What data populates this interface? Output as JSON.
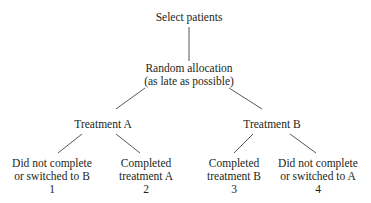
{
  "diagram": {
    "root": {
      "label": "Select patients"
    },
    "allocation": {
      "line1": "Random allocation",
      "line2": "(as late as possible)"
    },
    "treatments": [
      {
        "label": "Treatment A",
        "outcomes": [
          {
            "line1": "Did not complete",
            "line2": "or switched to B",
            "number": "1"
          },
          {
            "line1": "Completed",
            "line2": "treatment A",
            "number": "2"
          }
        ]
      },
      {
        "label": "Treatment B",
        "outcomes": [
          {
            "line1": "Completed",
            "line2": "treatment B",
            "number": "3"
          },
          {
            "line1": "Did not complete",
            "line2": "or switched to A",
            "number": "4"
          }
        ]
      }
    ]
  }
}
